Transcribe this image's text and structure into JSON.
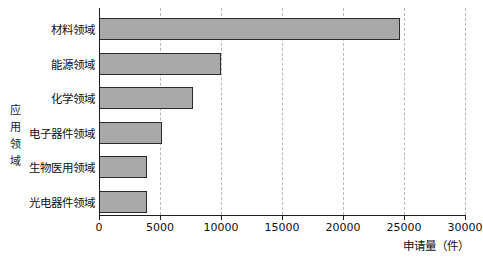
{
  "chart_data": {
    "type": "bar",
    "orientation": "horizontal",
    "title": "",
    "xlabel": "申请量（件）",
    "ylabel": "应用领域",
    "categories": [
      "材料领域",
      "能源领域",
      "化学领域",
      "电子器件领域",
      "生物医用领域",
      "光电器件领域"
    ],
    "values": [
      24700,
      10000,
      7700,
      5200,
      3900,
      3900
    ],
    "xlim": [
      0,
      30000
    ],
    "xticks": [
      0,
      5000,
      10000,
      15000,
      20000,
      25000,
      30000
    ],
    "xticklabels": [
      "0",
      "5000",
      "10000",
      "15000",
      "20000",
      "25000",
      "30000"
    ],
    "grid": "vertical-dashed",
    "legend": "none",
    "bar_fill": "#a9a9a9",
    "bar_edge": "#2b2b2b"
  },
  "axis": {
    "y_title_chars": [
      "应",
      "用",
      "领",
      "域"
    ],
    "x_title": "申请量（件）"
  },
  "caption": ""
}
